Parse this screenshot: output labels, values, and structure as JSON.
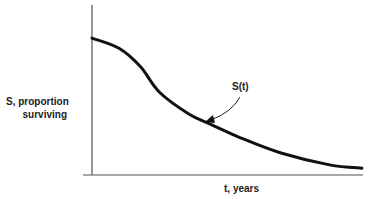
{
  "chart_data": {
    "type": "line",
    "title": "",
    "xlabel": "t, years",
    "ylabel_line1": "S, proportion",
    "ylabel_line2": "surviving",
    "xlim": [
      0,
      1
    ],
    "ylim": [
      0,
      1
    ],
    "grid": false,
    "ticks": "none",
    "series": [
      {
        "name": "S(t)",
        "x": [
          0,
          0.1,
          0.18,
          0.25,
          0.36,
          0.44,
          0.55,
          0.7,
          0.88,
          1.0
        ],
        "y": [
          0.81,
          0.75,
          0.64,
          0.49,
          0.36,
          0.3,
          0.22,
          0.13,
          0.06,
          0.04
        ]
      }
    ],
    "annotations": [
      {
        "text": "S(t)",
        "points_to_series": "S(t)",
        "arrow": true
      }
    ]
  }
}
